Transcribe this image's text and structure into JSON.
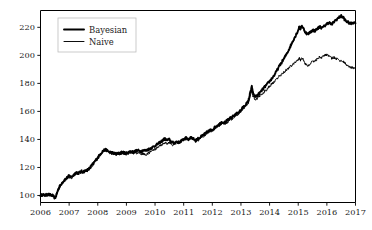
{
  "chart_data": {
    "type": "line",
    "title": "",
    "xlabel": "",
    "ylabel": "",
    "xlim": [
      2006.0,
      2017.0
    ],
    "ylim": [
      95,
      232
    ],
    "grid": false,
    "legend_position": "upper left",
    "xticks": [
      "2006",
      "2007",
      "2008",
      "2009",
      "2010",
      "2011",
      "2012",
      "2013",
      "2014",
      "2015",
      "2016",
      "2017"
    ],
    "xtick_values": [
      2006,
      2007,
      2008,
      2009,
      2010,
      2011,
      2012,
      2013,
      2014,
      2015,
      2016,
      2017
    ],
    "yticks": [
      "100",
      "120",
      "140",
      "160",
      "180",
      "200",
      "220"
    ],
    "ytick_values": [
      100,
      120,
      140,
      160,
      180,
      200,
      220
    ],
    "series": [
      {
        "name": "Bayesian",
        "color": "#000000",
        "linewidth": 1.9,
        "x": [
          2006.0,
          2006.08,
          2006.17,
          2006.25,
          2006.33,
          2006.42,
          2006.5,
          2006.54,
          2006.58,
          2006.62,
          2006.67,
          2006.75,
          2006.83,
          2006.92,
          2007.0,
          2007.08,
          2007.17,
          2007.25,
          2007.33,
          2007.42,
          2007.5,
          2007.58,
          2007.67,
          2007.75,
          2007.83,
          2007.92,
          2008.0,
          2008.08,
          2008.17,
          2008.25,
          2008.33,
          2008.42,
          2008.5,
          2008.58,
          2008.67,
          2008.75,
          2008.83,
          2008.92,
          2009.0,
          2009.08,
          2009.17,
          2009.25,
          2009.33,
          2009.42,
          2009.5,
          2009.58,
          2009.67,
          2009.75,
          2009.83,
          2009.92,
          2010.0,
          2010.08,
          2010.17,
          2010.25,
          2010.33,
          2010.42,
          2010.5,
          2010.58,
          2010.67,
          2010.75,
          2010.83,
          2010.92,
          2011.0,
          2011.08,
          2011.17,
          2011.25,
          2011.33,
          2011.42,
          2011.5,
          2011.58,
          2011.67,
          2011.75,
          2011.83,
          2011.92,
          2012.0,
          2012.08,
          2012.17,
          2012.25,
          2012.33,
          2012.42,
          2012.5,
          2012.58,
          2012.67,
          2012.75,
          2012.83,
          2012.92,
          2013.0,
          2013.08,
          2013.17,
          2013.25,
          2013.29,
          2013.33,
          2013.38,
          2013.42,
          2013.5,
          2013.58,
          2013.67,
          2013.75,
          2013.83,
          2013.92,
          2014.0,
          2014.08,
          2014.17,
          2014.25,
          2014.33,
          2014.42,
          2014.5,
          2014.58,
          2014.67,
          2014.75,
          2014.83,
          2014.92,
          2015.0,
          2015.04,
          2015.08,
          2015.12,
          2015.17,
          2015.25,
          2015.33,
          2015.42,
          2015.5,
          2015.58,
          2015.67,
          2015.75,
          2015.83,
          2015.92,
          2016.0,
          2016.08,
          2016.17,
          2016.25,
          2016.33,
          2016.42,
          2016.5,
          2016.58,
          2016.62,
          2016.67,
          2016.75,
          2016.83,
          2016.92,
          2017.0
        ],
        "y": [
          100.2,
          100.5,
          100.1,
          100.8,
          100.4,
          100.0,
          98.2,
          99.5,
          102.0,
          104.5,
          106.5,
          109.0,
          111.0,
          112.5,
          114.0,
          113.2,
          115.0,
          116.5,
          116.0,
          117.2,
          117.0,
          117.8,
          118.5,
          120.5,
          122.5,
          125.0,
          127.0,
          129.5,
          131.5,
          132.8,
          132.0,
          131.0,
          130.5,
          130.0,
          129.8,
          130.2,
          130.8,
          130.5,
          130.2,
          131.0,
          131.5,
          131.0,
          131.8,
          132.0,
          131.5,
          132.2,
          132.0,
          132.8,
          133.5,
          134.5,
          135.5,
          136.5,
          137.8,
          139.0,
          140.5,
          139.5,
          140.0,
          138.0,
          137.5,
          138.5,
          138.0,
          139.0,
          140.0,
          141.0,
          140.0,
          141.5,
          140.5,
          139.5,
          140.5,
          141.5,
          143.0,
          144.0,
          145.5,
          146.5,
          147.0,
          148.5,
          150.0,
          151.0,
          152.5,
          152.0,
          153.0,
          154.5,
          155.5,
          157.0,
          158.0,
          159.5,
          161.0,
          163.0,
          165.0,
          167.0,
          170.0,
          174.0,
          177.5,
          173.0,
          170.5,
          171.5,
          173.5,
          175.5,
          177.5,
          179.5,
          181.5,
          183.5,
          186.0,
          189.0,
          192.0,
          195.0,
          197.5,
          200.5,
          204.0,
          207.5,
          211.0,
          214.5,
          218.0,
          220.5,
          219.0,
          221.0,
          219.5,
          216.5,
          215.0,
          216.5,
          218.0,
          217.5,
          219.0,
          220.5,
          219.5,
          221.0,
          222.5,
          223.5,
          222.0,
          224.0,
          225.5,
          227.0,
          228.0,
          227.0,
          225.5,
          224.5,
          223.5,
          222.5,
          223.5,
          223.0
        ]
      },
      {
        "name": "Naive",
        "color": "#000000",
        "linewidth": 0.95,
        "x": [
          2006.0,
          2006.08,
          2006.17,
          2006.25,
          2006.33,
          2006.42,
          2006.5,
          2006.54,
          2006.58,
          2006.62,
          2006.67,
          2006.75,
          2006.83,
          2006.92,
          2007.0,
          2007.08,
          2007.17,
          2007.25,
          2007.33,
          2007.42,
          2007.5,
          2007.58,
          2007.67,
          2007.75,
          2007.83,
          2007.92,
          2008.0,
          2008.08,
          2008.17,
          2008.25,
          2008.33,
          2008.42,
          2008.5,
          2008.58,
          2008.67,
          2008.75,
          2008.83,
          2008.92,
          2009.0,
          2009.08,
          2009.17,
          2009.25,
          2009.33,
          2009.42,
          2009.5,
          2009.58,
          2009.67,
          2009.75,
          2009.83,
          2009.92,
          2010.0,
          2010.08,
          2010.17,
          2010.25,
          2010.33,
          2010.42,
          2010.5,
          2010.58,
          2010.67,
          2010.75,
          2010.83,
          2010.92,
          2011.0,
          2011.08,
          2011.17,
          2011.25,
          2011.33,
          2011.42,
          2011.5,
          2011.58,
          2011.67,
          2011.75,
          2011.83,
          2011.92,
          2012.0,
          2012.08,
          2012.17,
          2012.25,
          2012.33,
          2012.42,
          2012.5,
          2012.58,
          2012.67,
          2012.75,
          2012.83,
          2012.92,
          2013.0,
          2013.08,
          2013.17,
          2013.25,
          2013.29,
          2013.33,
          2013.38,
          2013.42,
          2013.5,
          2013.58,
          2013.67,
          2013.75,
          2013.83,
          2013.92,
          2014.0,
          2014.08,
          2014.17,
          2014.25,
          2014.33,
          2014.42,
          2014.5,
          2014.58,
          2014.67,
          2014.75,
          2014.83,
          2014.92,
          2015.0,
          2015.04,
          2015.08,
          2015.12,
          2015.17,
          2015.25,
          2015.33,
          2015.42,
          2015.5,
          2015.58,
          2015.67,
          2015.75,
          2015.83,
          2015.92,
          2016.0,
          2016.08,
          2016.17,
          2016.25,
          2016.33,
          2016.42,
          2016.5,
          2016.58,
          2016.62,
          2016.67,
          2016.75,
          2016.83,
          2016.92,
          2017.0
        ],
        "y": [
          100.2,
          100.4,
          100.0,
          100.7,
          100.3,
          99.8,
          98.0,
          99.3,
          101.8,
          104.2,
          106.2,
          108.5,
          110.5,
          112.0,
          113.2,
          112.5,
          114.2,
          115.8,
          115.2,
          116.5,
          116.2,
          117.0,
          117.8,
          119.8,
          121.8,
          124.5,
          126.5,
          129.0,
          131.0,
          132.5,
          131.5,
          130.5,
          130.0,
          129.5,
          129.0,
          129.5,
          130.0,
          129.8,
          129.5,
          130.0,
          130.5,
          129.8,
          130.5,
          130.2,
          129.5,
          129.8,
          129.0,
          130.0,
          131.0,
          132.0,
          133.0,
          134.0,
          135.5,
          136.5,
          137.5,
          137.0,
          138.0,
          136.5,
          136.0,
          137.5,
          137.5,
          138.5,
          140.0,
          141.5,
          140.5,
          142.0,
          140.0,
          138.5,
          139.5,
          140.5,
          142.0,
          143.0,
          144.5,
          145.5,
          146.0,
          147.5,
          149.0,
          150.0,
          151.5,
          151.0,
          152.0,
          153.5,
          154.5,
          156.0,
          157.0,
          158.5,
          160.0,
          162.0,
          164.0,
          166.0,
          168.5,
          172.0,
          175.0,
          171.0,
          168.5,
          169.5,
          171.0,
          172.5,
          174.5,
          176.0,
          178.0,
          179.5,
          181.0,
          183.0,
          185.0,
          186.5,
          188.0,
          189.5,
          191.0,
          192.5,
          194.0,
          195.5,
          197.0,
          198.5,
          196.5,
          198.5,
          197.0,
          194.0,
          192.5,
          194.0,
          195.5,
          196.0,
          197.5,
          199.0,
          198.5,
          200.0,
          200.5,
          199.5,
          198.0,
          198.5,
          197.5,
          196.5,
          196.0,
          195.5,
          194.5,
          193.5,
          192.5,
          191.5,
          191.0,
          190.5
        ]
      }
    ]
  },
  "legend": {
    "entries": [
      {
        "label": "Bayesian"
      },
      {
        "label": "Naive"
      }
    ]
  },
  "axes": {
    "x_tick_labels": [
      "2006",
      "2007",
      "2008",
      "2009",
      "2010",
      "2011",
      "2012",
      "2013",
      "2014",
      "2015",
      "2016",
      "2017"
    ],
    "y_tick_labels": [
      "100",
      "120",
      "140",
      "160",
      "180",
      "200",
      "220"
    ]
  }
}
